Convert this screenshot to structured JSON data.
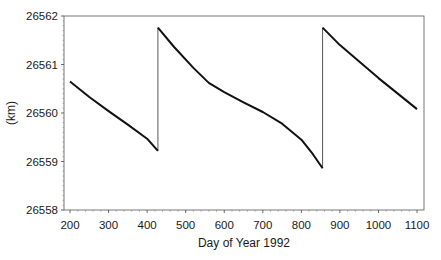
{
  "chart_data": {
    "type": "line",
    "title": "",
    "xlabel": "Day of Year 1992",
    "ylabel": "(km)",
    "xlim": [
      185,
      1118
    ],
    "ylim": [
      26558,
      26562
    ],
    "xticks": [
      200,
      300,
      400,
      500,
      600,
      700,
      800,
      900,
      1000,
      1100
    ],
    "yticks": [
      26558,
      26559,
      26560,
      26561,
      26562
    ],
    "grid": false,
    "legend": null,
    "series": [
      {
        "name": "semi-major axis",
        "color": "#111111",
        "x": [
          200,
          250,
          300,
          350,
          400,
          428,
          428,
          470,
          520,
          560,
          600,
          650,
          700,
          750,
          800,
          830,
          855,
          855,
          900,
          950,
          1000,
          1050,
          1100
        ],
        "y": [
          26560.65,
          26560.33,
          26560.04,
          26559.76,
          26559.47,
          26559.22,
          26561.76,
          26561.36,
          26560.93,
          26560.62,
          26560.43,
          26560.22,
          26560.02,
          26559.78,
          26559.45,
          26559.15,
          26558.86,
          26561.76,
          26561.4,
          26561.06,
          26560.72,
          26560.4,
          26560.08
        ]
      }
    ]
  },
  "plot": {
    "x_tick_labels": [
      "200",
      "300",
      "400",
      "500",
      "600",
      "700",
      "800",
      "900",
      "1000",
      "1100"
    ],
    "y_tick_labels": [
      "26558",
      "26559",
      "26560",
      "26561",
      "26562"
    ]
  }
}
